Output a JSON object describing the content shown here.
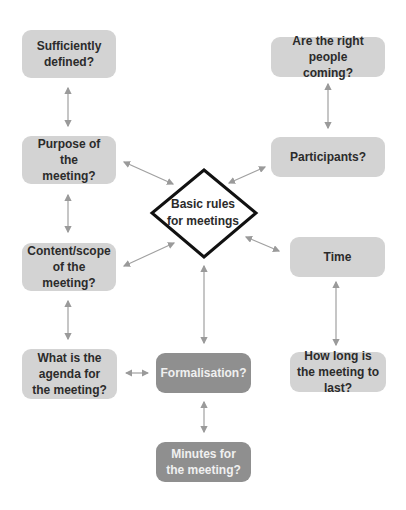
{
  "diagram": {
    "center": {
      "label_line1": "Basic rules",
      "label_line2": "for meetings"
    },
    "nodes": {
      "sufficiently_defined": "Sufficiently defined?",
      "purpose": "Purpose of the meeting?",
      "content_scope": "Content/scope of the meeting?",
      "agenda": "What is the agenda for the meeting?",
      "right_people": "Are the right people coming?",
      "participants": "Participants?",
      "time": "Time",
      "how_long": "How long is the meeting to last?",
      "formalisation": "Formalisation?",
      "minutes": "Minutes for the meeting?"
    },
    "colors": {
      "light_box": "#d3d3d3",
      "dark_box": "#8f8f8f",
      "arrow": "#9a9a9a",
      "diamond_border": "#111111"
    }
  }
}
